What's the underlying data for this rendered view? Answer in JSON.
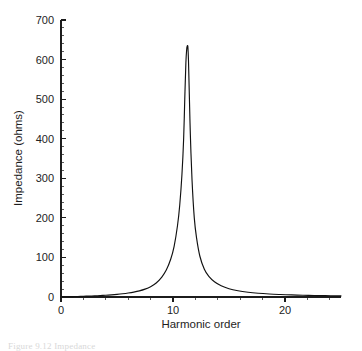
{
  "figure": {
    "background_color": "#ffffff",
    "curve_color": "#111111",
    "axis_color": "#1c1c1c",
    "caption": "Figure 9.12  Impedance"
  },
  "chart_data": {
    "type": "line",
    "title": "",
    "xlabel": "Harmonic order",
    "ylabel": "Impedance (ohms)",
    "xlim": [
      0,
      25
    ],
    "ylim": [
      0,
      700
    ],
    "grid": false,
    "legend": null,
    "x_ticks": [
      0,
      10,
      20
    ],
    "x_tick_labels": [
      "0",
      "10",
      "20"
    ],
    "x_minor_tick_step": 2,
    "y_ticks": [
      0,
      100,
      200,
      300,
      400,
      500,
      600,
      700
    ],
    "y_tick_labels": [
      "0",
      "100",
      "200",
      "300",
      "400",
      "500",
      "600",
      "700"
    ],
    "y_minor_tick_step": 20,
    "resonance_peak_harmonic": 11.3,
    "resonance_peak_impedance": 635,
    "series": [
      {
        "name": "Impedance magnitude",
        "x": [
          0.0,
          0.5,
          1.0,
          1.5,
          2.0,
          2.5,
          3.0,
          3.5,
          4.0,
          4.5,
          5.0,
          5.5,
          6.0,
          6.5,
          7.0,
          7.5,
          8.0,
          8.5,
          9.0,
          9.4,
          9.8,
          10.1,
          10.4,
          10.6,
          10.8,
          10.95,
          11.05,
          11.15,
          11.22,
          11.27,
          11.3,
          11.33,
          11.38,
          11.45,
          11.55,
          11.7,
          11.9,
          12.1,
          12.4,
          12.8,
          13.2,
          13.7,
          14.3,
          15.0,
          15.8,
          16.7,
          17.6,
          18.6,
          19.6,
          20.6,
          21.6,
          22.6,
          23.6,
          24.3,
          25.0
        ],
        "y": [
          0.5,
          0.7,
          1.0,
          1.4,
          1.8,
          2.3,
          2.9,
          3.6,
          4.4,
          5.4,
          6.6,
          8.1,
          10.0,
          12.4,
          15.6,
          20.0,
          26.2,
          35.5,
          50.5,
          68.0,
          96.0,
          128.0,
          180.0,
          232.0,
          310.0,
          400.0,
          500.0,
          592.0,
          625.0,
          634.0,
          635.0,
          631.0,
          600.0,
          520.0,
          410.0,
          295.0,
          200.0,
          150.0,
          103.0,
          70.0,
          52.0,
          38.5,
          28.5,
          21.0,
          15.8,
          12.0,
          9.4,
          7.5,
          6.2,
          5.2,
          4.4,
          3.8,
          3.3,
          3.0,
          2.8
        ]
      }
    ]
  }
}
